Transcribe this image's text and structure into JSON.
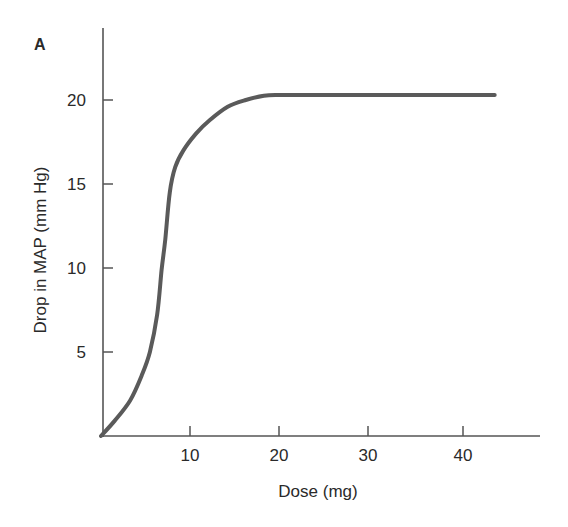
{
  "panel_label": "A",
  "chart_data": {
    "type": "line",
    "title": "",
    "xlabel": "Dose (mg)",
    "ylabel": "Drop in MAP (mm Hg)",
    "xlim": [
      0,
      48
    ],
    "ylim": [
      0,
      22
    ],
    "x_ticks": [
      10,
      20,
      30,
      40
    ],
    "y_ticks": [
      5,
      10,
      15,
      20
    ],
    "grid": false,
    "legend": null,
    "series": [
      {
        "name": "Dose-response",
        "color": "#5a5a5a",
        "x": [
          0,
          1.5,
          3.2,
          4.5,
          5.4,
          6.2,
          6.7,
          7.1,
          7.6,
          8.2,
          9.1,
          10.5,
          12,
          14,
          16,
          18,
          19.5,
          20,
          25,
          30,
          35,
          40,
          43.5
        ],
        "y": [
          0,
          0.9,
          2.1,
          3.6,
          5.0,
          7.2,
          9.9,
          11.7,
          14.5,
          16.0,
          17.0,
          18.0,
          18.8,
          19.6,
          20.0,
          20.25,
          20.3,
          20.3,
          20.3,
          20.3,
          20.3,
          20.3,
          20.3
        ]
      }
    ]
  },
  "axes": {
    "x_tick_labels": [
      "10",
      "20",
      "30",
      "40"
    ],
    "y_tick_labels": [
      "5",
      "10",
      "15",
      "20"
    ]
  }
}
